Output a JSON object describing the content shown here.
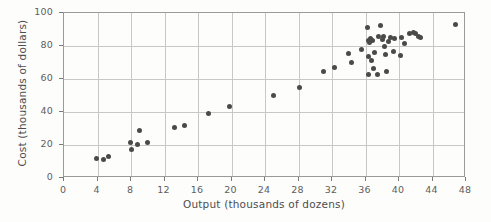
{
  "chart_data": {
    "type": "scatter",
    "title": "",
    "xlabel": "Output (thousands of dozens)",
    "ylabel": "Cost (thousands of dollars)",
    "xlim": [
      0,
      48
    ],
    "ylim": [
      0,
      100
    ],
    "xticks": [
      0,
      4,
      8,
      12,
      16,
      20,
      24,
      28,
      32,
      36,
      40,
      44,
      48
    ],
    "yticks": [
      0,
      20,
      40,
      60,
      80,
      100
    ],
    "xticklabels": [
      "0",
      "4",
      "8",
      "12",
      "16",
      "20",
      "24",
      "28",
      "32",
      "36",
      "40",
      "44",
      "48"
    ],
    "yticklabels": [
      "0",
      "20",
      "40",
      "60",
      "80",
      "100"
    ],
    "grid": true,
    "legend": false,
    "marker_color": "#4a4a4a",
    "grid_color": "#c8c8c8",
    "frame_color": "#9a9a9a",
    "background_color": "#fdfdfc",
    "series": [
      {
        "name": "Cost vs Output",
        "points": [
          [
            3.9,
            12.0
          ],
          [
            4.7,
            11.2
          ],
          [
            5.3,
            12.8
          ],
          [
            7.9,
            21.6
          ],
          [
            8.1,
            17.2
          ],
          [
            8.8,
            20.2
          ],
          [
            9.0,
            29.0
          ],
          [
            10.0,
            21.4
          ],
          [
            13.2,
            30.5
          ],
          [
            14.4,
            31.7
          ],
          [
            17.2,
            39.0
          ],
          [
            19.8,
            43.3
          ],
          [
            25.0,
            50.3
          ],
          [
            28.1,
            55.0
          ],
          [
            31.0,
            64.8
          ],
          [
            32.3,
            67.0
          ],
          [
            34.0,
            75.5
          ],
          [
            34.3,
            70.0
          ],
          [
            35.5,
            77.8
          ],
          [
            36.2,
            91.5
          ],
          [
            36.3,
            83.6
          ],
          [
            36.6,
            84.8
          ],
          [
            36.5,
            81.9
          ],
          [
            36.8,
            83.2
          ],
          [
            36.4,
            73.5
          ],
          [
            36.7,
            71.5
          ],
          [
            36.4,
            62.5
          ],
          [
            37.1,
            76.3
          ],
          [
            37.0,
            66.5
          ],
          [
            37.4,
            63.0
          ],
          [
            37.6,
            85.5
          ],
          [
            37.8,
            92.5
          ],
          [
            38.0,
            84.0
          ],
          [
            38.2,
            86.0
          ],
          [
            38.3,
            79.5
          ],
          [
            38.4,
            75.0
          ],
          [
            38.5,
            64.5
          ],
          [
            38.8,
            82.5
          ],
          [
            39.0,
            85.2
          ],
          [
            39.3,
            76.5
          ],
          [
            39.5,
            84.7
          ],
          [
            40.3,
            85.0
          ],
          [
            40.2,
            74.2
          ],
          [
            40.6,
            81.5
          ],
          [
            41.3,
            87.4
          ],
          [
            41.7,
            88.0
          ],
          [
            42.0,
            87.5
          ],
          [
            42.3,
            86.0
          ],
          [
            42.6,
            85.0
          ],
          [
            46.8,
            93.3
          ]
        ]
      }
    ]
  }
}
